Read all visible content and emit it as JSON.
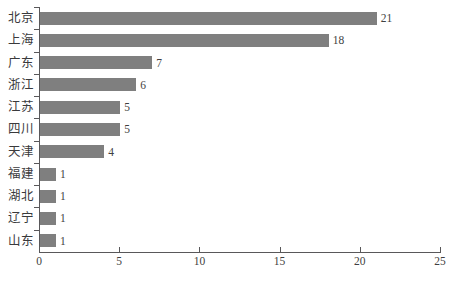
{
  "chart_data": {
    "type": "bar",
    "orientation": "horizontal",
    "title": "",
    "subtitle": "",
    "xlabel": "",
    "ylabel": "",
    "categories": [
      "北京",
      "上海",
      "广东",
      "浙江",
      "江苏",
      "四川",
      "天津",
      "福建",
      "湖北",
      "辽宁",
      "山东"
    ],
    "values": [
      21,
      18,
      7,
      6,
      5,
      5,
      4,
      1,
      1,
      1,
      1
    ],
    "data_labels": [
      "21",
      "18",
      "7",
      "6",
      "5",
      "5",
      "4",
      "1",
      "1",
      "1",
      "1"
    ],
    "xlim": [
      0,
      25
    ],
    "xticks": [
      0,
      5,
      10,
      15,
      20,
      25
    ],
    "xtick_labels": [
      "0",
      "5",
      "10",
      "15",
      "20",
      "25"
    ],
    "grid": false,
    "legend": null,
    "legend_position": "none",
    "bar_color": "#7f7f7f",
    "axis_color": "#59585a",
    "text_color": "#3f3f41",
    "background_color": "#ffffff"
  }
}
